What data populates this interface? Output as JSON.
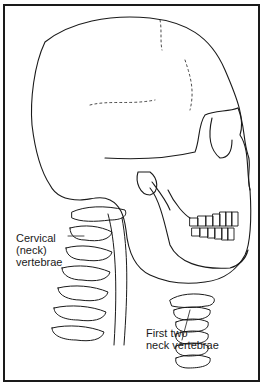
{
  "figure": {
    "labels": {
      "cervical": "Cervical\n(neck)\nvertebrae",
      "first_two": "First two\nneck vertebrae"
    }
  }
}
